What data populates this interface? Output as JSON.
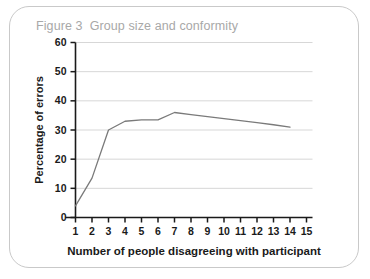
{
  "figure": {
    "number_label": "Figure 3",
    "title": "Group size and conformity",
    "title_color": "#a8a8a8",
    "border_color": "#c9c9c9"
  },
  "chart_data": {
    "type": "line",
    "title": "Group size and conformity",
    "xlabel": "Number of people disagreeing with participant",
    "ylabel": "Percentage of errors",
    "x": [
      1,
      2,
      3,
      4,
      5,
      6,
      7,
      8,
      9,
      10,
      11,
      12,
      13,
      14
    ],
    "values": [
      4,
      13.5,
      30,
      33,
      33.5,
      33.5,
      36,
      35.3,
      34.6,
      33.9,
      33.2,
      32.5,
      31.8,
      31
    ],
    "series": [
      {
        "name": "Percentage of errors",
        "values": [
          4,
          13.5,
          30,
          33,
          33.5,
          33.5,
          36,
          35.3,
          34.6,
          33.9,
          33.2,
          32.5,
          31.8,
          31
        ],
        "color": "#7a7a7a"
      }
    ],
    "xlim": [
      0,
      15
    ],
    "ylim": [
      0,
      60
    ],
    "xticks": [
      1,
      2,
      3,
      4,
      5,
      6,
      7,
      8,
      9,
      10,
      11,
      12,
      13,
      14,
      15
    ],
    "yticks": [
      0,
      10,
      20,
      30,
      40,
      50,
      60
    ],
    "xtick_labels": [
      "1",
      "2",
      "3",
      "4",
      "5",
      "6",
      "7",
      "8",
      "9",
      "10",
      "11",
      "12",
      "13",
      "14",
      "15"
    ],
    "ytick_labels": [
      "0",
      "10",
      "20",
      "30",
      "40",
      "50",
      "60"
    ],
    "grid": "horizontal",
    "legend": "none",
    "line_color": "#7a7a7a",
    "grid_color": "#d7d7d7",
    "axis_color": "#1a1a1a"
  }
}
